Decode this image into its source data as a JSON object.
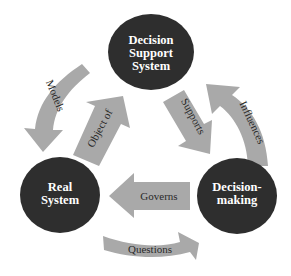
{
  "diagram": {
    "type": "cycle",
    "colors": {
      "node_fill": "#2e2e2e",
      "node_text": "#ffffff",
      "arrow_fill": "#a9a9a9",
      "arrow_text": "#2a2a2a",
      "background": "#ffffff"
    },
    "nodes": {
      "dss": {
        "line1": "Decision",
        "line2": "Support",
        "line3": "System"
      },
      "real": {
        "line1": "Real",
        "line2": "System"
      },
      "decision": {
        "line1": "Decision-",
        "line2": "making"
      }
    },
    "arrows": {
      "models": {
        "label": "Models",
        "from": "Decision Support System",
        "to": "Real System"
      },
      "object_of": {
        "label": "Object of",
        "from": "Real System",
        "to": "Decision Support System"
      },
      "supports": {
        "label": "Supports",
        "from": "Decision Support System",
        "to": "Decision-making"
      },
      "influences": {
        "label": "Influences",
        "from": "Decision-making",
        "to": "Decision Support System"
      },
      "governs": {
        "label": "Governs",
        "from": "Decision-making",
        "to": "Real System"
      },
      "questions": {
        "label": "Questions",
        "from": "Real System",
        "to": "Decision-making"
      }
    }
  }
}
